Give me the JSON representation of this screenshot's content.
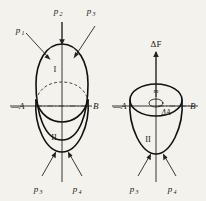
{
  "figure": {
    "background_color": "#f4f2ec",
    "ink_color": "#111111",
    "left_diagram": {
      "name": "closed-egg-body",
      "shape": "egg",
      "region_upper_label": "I",
      "region_lower_label": "II",
      "axis_left_label": "—A",
      "axis_right_label": "B",
      "pressure_labels_top": [
        "p₁",
        "p₂",
        "p₃"
      ],
      "pressure_labels_bottom": [
        "p₃",
        "p₄"
      ],
      "top_pressures": [
        {
          "label_main": "p",
          "label_sub": "1"
        },
        {
          "label_main": "p",
          "label_sub": "2"
        },
        {
          "label_main": "p",
          "label_sub": "3"
        }
      ],
      "bottom_pressures": [
        {
          "label_main": "p",
          "label_sub": "3"
        },
        {
          "label_main": "p",
          "label_sub": "4"
        }
      ]
    },
    "right_diagram": {
      "name": "open-bowl-body",
      "shape": "bowl",
      "force_label": "ΔF",
      "mass_label": "m",
      "area_label": "ΔA",
      "region_lower_label": "II",
      "axis_left_label": "—A",
      "axis_right_label": "B",
      "bottom_pressures": [
        {
          "label_main": "p",
          "label_sub": "3"
        },
        {
          "label_main": "p",
          "label_sub": "4"
        }
      ]
    }
  }
}
